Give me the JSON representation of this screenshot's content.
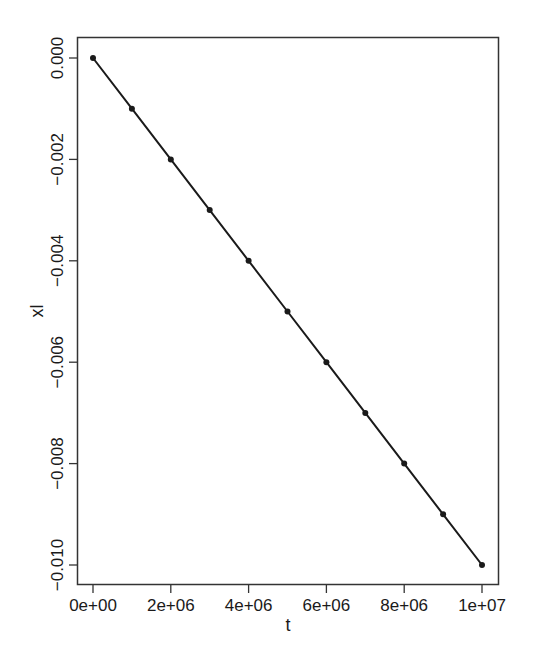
{
  "chart_data": {
    "type": "line",
    "title": "",
    "xlabel": "t",
    "ylabel": "xl",
    "x": [
      0,
      1000000,
      2000000,
      3000000,
      4000000,
      5000000,
      6000000,
      7000000,
      8000000,
      9000000,
      10000000
    ],
    "series": [
      {
        "name": "xl",
        "values": [
          0.0,
          -0.001,
          -0.002,
          -0.003,
          -0.004,
          -0.005,
          -0.006,
          -0.007,
          -0.008,
          -0.009,
          -0.01
        ],
        "style": "line+points",
        "color": "#1a1a1a"
      }
    ],
    "xticks": [
      0,
      2000000,
      4000000,
      6000000,
      8000000,
      10000000
    ],
    "xtick_labels": [
      "0e+00",
      "2e+06",
      "4e+06",
      "6e+06",
      "8e+06",
      "1e+07"
    ],
    "yticks": [
      0.0,
      -0.002,
      -0.004,
      -0.006,
      -0.008,
      -0.01
    ],
    "ytick_labels": [
      "0.000",
      "−0.002",
      "−0.004",
      "−0.006",
      "−0.008",
      "−0.010"
    ],
    "xlim": [
      -400000,
      10400000
    ],
    "ylim": [
      -0.0104,
      0.0004
    ],
    "grid": false,
    "legend": null
  }
}
